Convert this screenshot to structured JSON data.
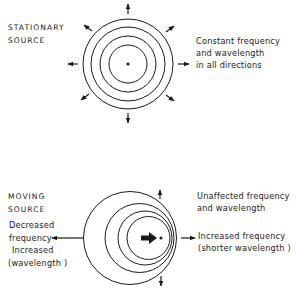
{
  "stationary": {
    "title_line1": "STATIONARY",
    "title_line2": "SOURCE",
    "note": [
      "Constant frequency",
      "and wavelength",
      "in all directions"
    ]
  },
  "moving": {
    "title_line1": "MOVING",
    "title_line2": "SOURCE",
    "rear_note": [
      "Decreased",
      "frequency",
      "Increased",
      "(wavelength )"
    ],
    "side_note": [
      "Unaffected frequency",
      "and wavelength"
    ],
    "front_note": [
      "Increased frequency",
      "(shorter wavelength )"
    ]
  },
  "colors": {
    "ink": "#1a1a1a",
    "background": "#ffffff"
  }
}
